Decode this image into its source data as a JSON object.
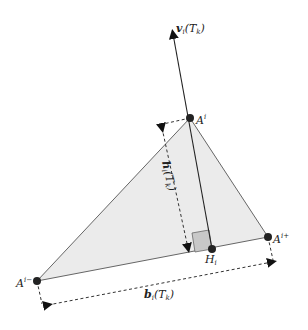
{
  "diagram": {
    "labels": {
      "normal_vector": "v",
      "normal_vector_sub": "i",
      "normal_vector_arg": "(T",
      "normal_vector_arg_sub": "k",
      "normal_vector_close": ")",
      "apex": "A",
      "apex_sup": "i",
      "left_vertex": "A",
      "left_vertex_sup": "i−",
      "right_vertex": "A",
      "right_vertex_sup": "i+",
      "foot": "H",
      "foot_sub": "i",
      "height": "h",
      "height_sub": "i",
      "height_arg": "(T",
      "height_arg_sub": "k",
      "height_close": ")",
      "base": "b",
      "base_sub": "i",
      "base_arg": "(T",
      "base_arg_sub": "k",
      "base_close": ")"
    },
    "colors": {
      "triangle_fill": "#ebebeb",
      "triangle_stroke": "#666666",
      "right_angle_fill": "#c8c8c8",
      "point": "#222222",
      "line": "#222222"
    }
  }
}
